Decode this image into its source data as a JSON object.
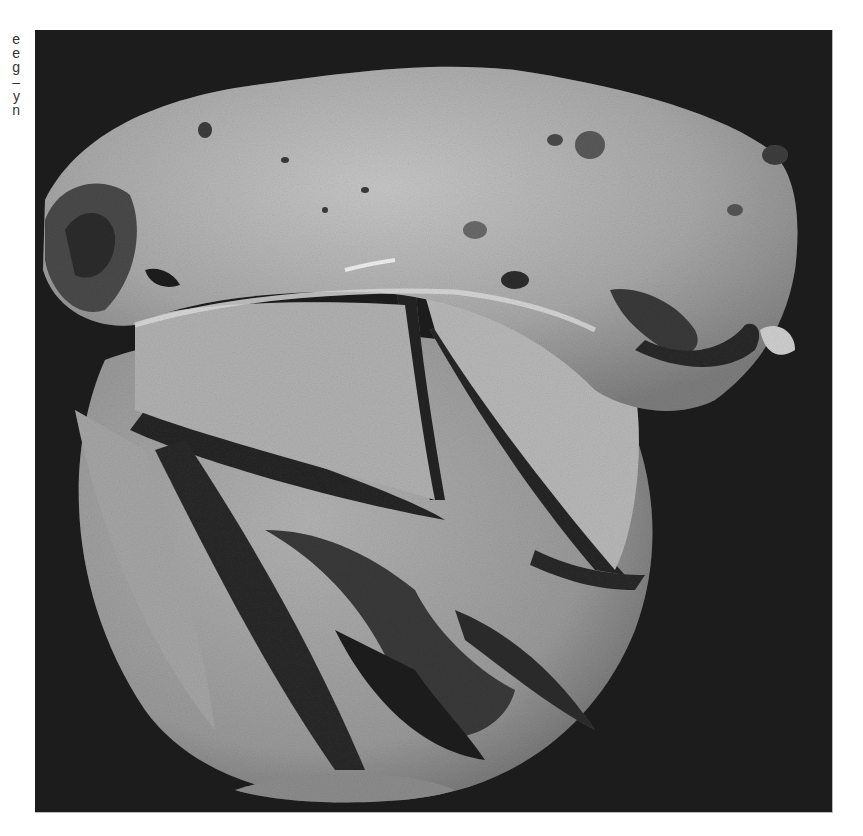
{
  "caption_fragment": {
    "lines": [
      "e",
      "e",
      "g",
      "–",
      "y",
      "n"
    ]
  },
  "photo": {
    "subject": "grayscale photograph of a sectioned rounded specimen with folded membranous lower portion on a black background",
    "background_color": "#1c1c1c",
    "specimen_color_light": "#bdbdbd",
    "specimen_color_mid": "#8a8a8a",
    "specimen_color_dark": "#2a2a2a"
  }
}
